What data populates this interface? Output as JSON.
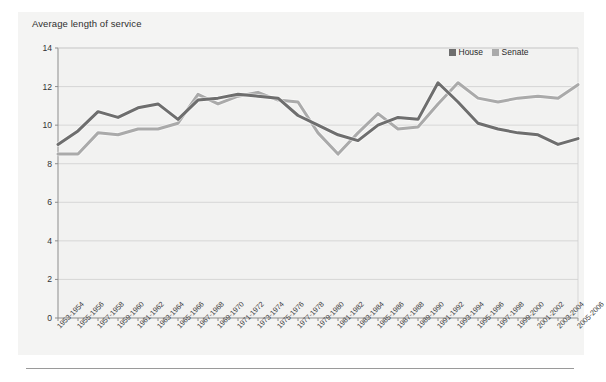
{
  "figure": {
    "background_color": "#f4f4f3",
    "plot_background_color": "#f2f2f1"
  },
  "chart_data": {
    "type": "line",
    "title": "Average length of service",
    "xlabel": "",
    "ylabel": "",
    "ylim": [
      0,
      14
    ],
    "yticks": [
      0,
      2,
      4,
      6,
      8,
      10,
      12,
      14
    ],
    "grid": true,
    "legend_position": "top-right",
    "categories": [
      "1953-1954",
      "1955-1956",
      "1957-1958",
      "1959-1960",
      "1961-1962",
      "1963-1964",
      "1965-1966",
      "1967-1968",
      "1969-1970",
      "1971-1972",
      "1973-1974",
      "1975-1976",
      "1977-1978",
      "1979-1980",
      "1981-1982",
      "1983-1984",
      "1985-1986",
      "1987-1988",
      "1989-1990",
      "1991-1992",
      "1993-1994",
      "1995-1996",
      "1997-1998",
      "1999-2000",
      "2001-2002",
      "2003-2004",
      "2005-2006"
    ],
    "series": [
      {
        "name": "House",
        "color": "#6e6e6e",
        "values": [
          9.0,
          9.7,
          10.7,
          10.4,
          10.9,
          11.1,
          10.3,
          11.3,
          11.4,
          11.6,
          11.5,
          11.4,
          10.5,
          10.0,
          9.5,
          9.2,
          10.0,
          10.4,
          10.3,
          12.2,
          11.2,
          10.1,
          9.8,
          9.6,
          9.5,
          9.0,
          9.3
        ]
      },
      {
        "name": "Senate",
        "color": "#aaaaaa",
        "values": [
          8.5,
          8.5,
          9.6,
          9.5,
          9.8,
          9.8,
          10.1,
          11.6,
          11.1,
          11.5,
          11.7,
          11.3,
          11.2,
          9.6,
          8.5,
          9.6,
          10.6,
          9.8,
          9.9,
          11.1,
          12.2,
          11.4,
          11.2,
          11.4,
          11.5,
          11.4,
          12.1
        ]
      }
    ]
  },
  "legend": {
    "items": [
      {
        "label": "House",
        "color": "#6e6e6e"
      },
      {
        "label": "Senate",
        "color": "#aaaaaa"
      }
    ]
  }
}
